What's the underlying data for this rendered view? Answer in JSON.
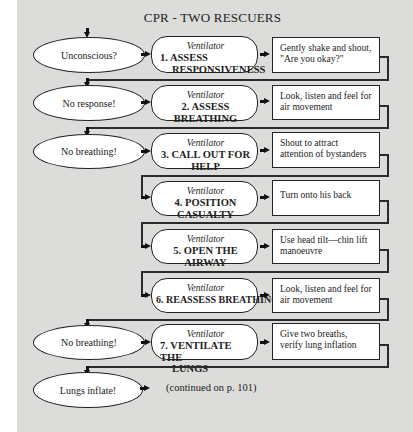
{
  "title": "CPR - TWO RESCUERS",
  "conditions": [
    {
      "label": "Unconscious?"
    },
    {
      "label": "No response!"
    },
    {
      "label": "No breathing!"
    },
    {
      "label": "No breathing!"
    },
    {
      "label": "Lungs inflate!"
    }
  ],
  "steps": [
    {
      "tool": "Ventilator",
      "line1": "1. ASSESS",
      "line2": "RESPONSIVENESS",
      "action_line1": "Gently shake and shout,",
      "action_line2": "\"Are you okay?\""
    },
    {
      "tool": "Ventilator",
      "line1": "2. ASSESS BREATHING",
      "line2": "",
      "action_line1": "Look, listen and feel for",
      "action_line2": "air movement"
    },
    {
      "tool": "Ventilator",
      "line1": "3. CALL OUT FOR HELP",
      "line2": "",
      "action_line1": "Shout to attract",
      "action_line2": "attention of bystanders"
    },
    {
      "tool": "Ventilator",
      "line1": "4. POSITION CASUALTY",
      "line2": "",
      "action_line1": "Turn onto his back",
      "action_line2": ""
    },
    {
      "tool": "Ventilator",
      "line1": "5. OPEN THE AIRWAY",
      "line2": "",
      "action_line1": "Use head tilt—chin lift",
      "action_line2": "manoeuvre"
    },
    {
      "tool": "Ventilator",
      "line1": "6. REASSESS BREATHING",
      "line2": "",
      "action_line1": "Look, listen and feel for",
      "action_line2": "air movement"
    },
    {
      "tool": "Ventilator",
      "line1": "7. VENTILATE THE",
      "line2": "LUNGS",
      "action_line1": "Give two breaths,",
      "action_line2": "verify lung inflation"
    }
  ],
  "continuation": "(continued on p. 101)",
  "colors": {
    "background": "#dcdcda",
    "shape_fill": "#ffffff",
    "stroke": "#222222"
  }
}
